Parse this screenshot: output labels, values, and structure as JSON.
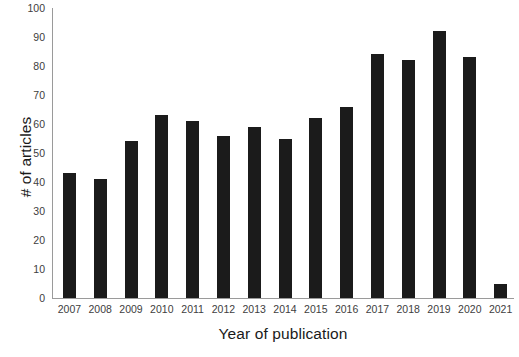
{
  "chart_data": {
    "type": "bar",
    "title": "",
    "xlabel": "Year of publication",
    "ylabel": "# of articles",
    "categories": [
      "2007",
      "2008",
      "2009",
      "2010",
      "2011",
      "2012",
      "2013",
      "2014",
      "2015",
      "2016",
      "2017",
      "2018",
      "2019",
      "2020",
      "2021"
    ],
    "values": [
      43,
      41,
      54,
      63,
      61,
      56,
      59,
      55,
      62,
      66,
      84,
      82,
      92,
      83,
      5
    ],
    "ylim": [
      0,
      100
    ],
    "ytick_labels": [
      "0",
      "10",
      "20",
      "30",
      "40",
      "50",
      "60",
      "70",
      "80",
      "90",
      "100"
    ],
    "ytick_values": [
      0,
      10,
      20,
      30,
      40,
      50,
      60,
      70,
      80,
      90,
      100
    ],
    "grid": false,
    "legend": null,
    "bar_color": "#1b1b1b",
    "axis_color": "#9a9a9a",
    "background_color": "#ffffff"
  }
}
